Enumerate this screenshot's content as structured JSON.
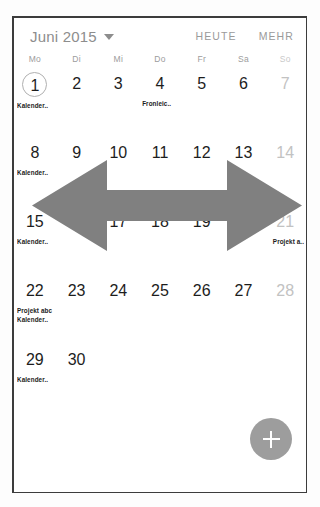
{
  "header": {
    "month_label": "Juni 2015",
    "caret_icon": "chevron-down-icon",
    "today_label": "HEUTE",
    "more_label": "MEHR"
  },
  "weekdays": [
    {
      "label": "Mo",
      "weekend": false
    },
    {
      "label": "Di",
      "weekend": false
    },
    {
      "label": "Mi",
      "weekend": false
    },
    {
      "label": "Do",
      "weekend": false
    },
    {
      "label": "Fr",
      "weekend": false
    },
    {
      "label": "Sa",
      "weekend": false
    },
    {
      "label": "So",
      "weekend": true
    }
  ],
  "weeks": [
    [
      {
        "num": "1",
        "today": true,
        "weekend": false,
        "events": [
          "Kalender.."
        ]
      },
      {
        "num": "2",
        "today": false,
        "weekend": false,
        "events": []
      },
      {
        "num": "3",
        "today": false,
        "weekend": false,
        "events": []
      },
      {
        "num": "4",
        "today": false,
        "weekend": false,
        "events": [
          "Fronleic.."
        ]
      },
      {
        "num": "5",
        "today": false,
        "weekend": false,
        "events": []
      },
      {
        "num": "6",
        "today": false,
        "weekend": false,
        "events": []
      },
      {
        "num": "7",
        "today": false,
        "weekend": true,
        "events": []
      }
    ],
    [
      {
        "num": "8",
        "today": false,
        "weekend": false,
        "events": [
          "Kalender.."
        ]
      },
      {
        "num": "9",
        "today": false,
        "weekend": false,
        "events": []
      },
      {
        "num": "10",
        "today": false,
        "weekend": false,
        "events": []
      },
      {
        "num": "11",
        "today": false,
        "weekend": false,
        "events": []
      },
      {
        "num": "12",
        "today": false,
        "weekend": false,
        "events": []
      },
      {
        "num": "13",
        "today": false,
        "weekend": false,
        "events": []
      },
      {
        "num": "14",
        "today": false,
        "weekend": true,
        "events": []
      }
    ],
    [
      {
        "num": "15",
        "today": false,
        "weekend": false,
        "events": [
          "Kalender.."
        ]
      },
      {
        "num": "16",
        "today": false,
        "weekend": false,
        "events": []
      },
      {
        "num": "17",
        "today": false,
        "weekend": false,
        "events": []
      },
      {
        "num": "18",
        "today": false,
        "weekend": false,
        "events": []
      },
      {
        "num": "19",
        "today": false,
        "weekend": false,
        "events": []
      },
      {
        "num": "20",
        "today": false,
        "weekend": false,
        "events": []
      },
      {
        "num": "21",
        "today": false,
        "weekend": true,
        "events": [
          "Projekt a.."
        ]
      }
    ],
    [
      {
        "num": "22",
        "today": false,
        "weekend": false,
        "events": [
          "Projekt abc",
          "Kalender.."
        ]
      },
      {
        "num": "23",
        "today": false,
        "weekend": false,
        "events": []
      },
      {
        "num": "24",
        "today": false,
        "weekend": false,
        "events": []
      },
      {
        "num": "25",
        "today": false,
        "weekend": false,
        "events": []
      },
      {
        "num": "26",
        "today": false,
        "weekend": false,
        "events": []
      },
      {
        "num": "27",
        "today": false,
        "weekend": false,
        "events": []
      },
      {
        "num": "28",
        "today": false,
        "weekend": true,
        "events": []
      }
    ],
    [
      {
        "num": "29",
        "today": false,
        "weekend": false,
        "events": [
          "Kalender.."
        ]
      },
      {
        "num": "30",
        "today": false,
        "weekend": false,
        "events": []
      },
      {
        "num": "",
        "today": false,
        "weekend": false,
        "events": []
      },
      {
        "num": "",
        "today": false,
        "weekend": false,
        "events": []
      },
      {
        "num": "",
        "today": false,
        "weekend": false,
        "events": []
      },
      {
        "num": "",
        "today": false,
        "weekend": false,
        "events": []
      },
      {
        "num": "",
        "today": false,
        "weekend": true,
        "events": []
      }
    ]
  ],
  "annotation": {
    "icon": "double-headed-horizontal-arrow",
    "color": "#808080"
  },
  "fab": {
    "icon": "plus-icon",
    "color": "#9d9d9d"
  }
}
